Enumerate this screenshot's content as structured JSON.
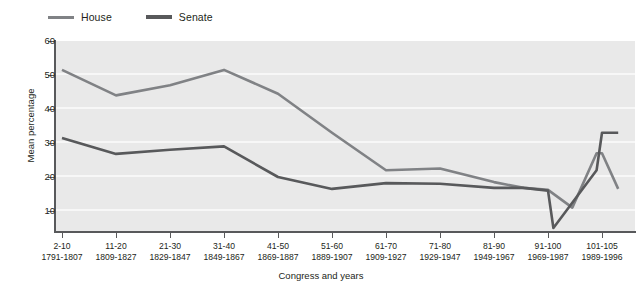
{
  "chart_data": {
    "type": "line",
    "title": "",
    "xlabel": "Congress and years",
    "ylabel": "Mean percentage",
    "ylim": [
      0,
      60
    ],
    "yticks": [
      10,
      20,
      30,
      40,
      50,
      60
    ],
    "grid": "horizontal",
    "legend_position": "top-left",
    "categories": [
      "2-10\n1791-1807",
      "11-20\n1809-1827",
      "21-30\n1829-1847",
      "31-40\n1849-1867",
      "41-50\n1869-1887",
      "51-60\n1889-1907",
      "61-70\n1909-1927",
      "71-80\n1929-1947",
      "81-90\n1949-1967",
      "91-100\n1969-1987",
      "101-105\n1989-1996"
    ],
    "series": [
      {
        "name": "House",
        "color": "#808285",
        "values": [
          51.5,
          44.0,
          47.0,
          51.5,
          44.5,
          33.0,
          22.0,
          22.5,
          18.5,
          16.2,
          27.0
        ],
        "extra_points": [
          {
            "x_index": 9.55,
            "value": 16.8
          },
          {
            "x_index": 10.0,
            "value": 9.0
          },
          {
            "x_index": 10.45,
            "value": 11.0
          },
          {
            "x_index": 10.9,
            "value": 27.0
          },
          {
            "x_index": 11.3,
            "value": 16.5
          }
        ]
      },
      {
        "name": "Senate",
        "color": "#58595b",
        "values": [
          31.5,
          26.8,
          28.0,
          29.0,
          20.0,
          16.5,
          18.2,
          18.0,
          16.8,
          16.0,
          33.0
        ],
        "extra_points": [
          {
            "x_index": 9.55,
            "value": 16.8
          },
          {
            "x_index": 10.1,
            "value": 5.0
          },
          {
            "x_index": 10.9,
            "value": 22.0
          },
          {
            "x_index": 11.3,
            "value": 33.0
          }
        ]
      }
    ]
  },
  "legend": {
    "entries": [
      {
        "label": "House",
        "color": "#808285",
        "icon": "line-swatch-icon"
      },
      {
        "label": "Senate",
        "color": "#58595b",
        "icon": "line-swatch-icon"
      }
    ]
  },
  "axes": {
    "y": {
      "title": "Mean percentage",
      "tick_labels": [
        "60",
        "50",
        "40",
        "30",
        "20",
        "10"
      ]
    },
    "x": {
      "title": "Congress and years",
      "tick_labels": [
        {
          "congress": "2-10",
          "years": "1791-1807"
        },
        {
          "congress": "11-20",
          "years": "1809-1827"
        },
        {
          "congress": "21-30",
          "years": "1829-1847"
        },
        {
          "congress": "31-40",
          "years": "1849-1867"
        },
        {
          "congress": "41-50",
          "years": "1869-1887"
        },
        {
          "congress": "51-60",
          "years": "1889-1907"
        },
        {
          "congress": "61-70",
          "years": "1909-1927"
        },
        {
          "congress": "71-80",
          "years": "1929-1947"
        },
        {
          "congress": "81-90",
          "years": "1949-1967"
        },
        {
          "congress": "91-100",
          "years": "1969-1987"
        },
        {
          "congress": "101-105",
          "years": "1989-1996"
        }
      ]
    }
  },
  "colors": {
    "plot_background": "#e9e9e9",
    "gridline": "#f7f7f7",
    "axis": "#58595b",
    "text": "#231f20",
    "house": "#808285",
    "senate": "#58595b"
  }
}
